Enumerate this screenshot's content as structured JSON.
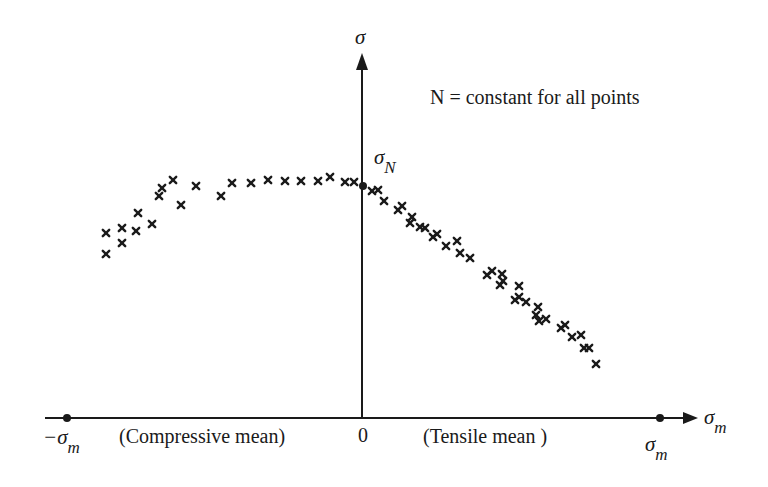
{
  "chart_data": {
    "type": "scatter",
    "title": "",
    "annotation": "N = constant for all points",
    "xlabel": "σm",
    "ylabel": "σ",
    "x_region_labels": [
      "(Compressive mean)",
      "(Tensile mean )"
    ],
    "x_ticks": [
      "−σm",
      "0",
      "σm"
    ],
    "y_marker": "σN",
    "grid": false,
    "legend": "none",
    "marker": "x",
    "points_px": [
      [
        106,
        233
      ],
      [
        106,
        254
      ],
      [
        122,
        228
      ],
      [
        122,
        243
      ],
      [
        138,
        213
      ],
      [
        136,
        231
      ],
      [
        152,
        224
      ],
      [
        159,
        196
      ],
      [
        162,
        188
      ],
      [
        173,
        180
      ],
      [
        181,
        205
      ],
      [
        196,
        186
      ],
      [
        221,
        196
      ],
      [
        232,
        183
      ],
      [
        251,
        183
      ],
      [
        268,
        180
      ],
      [
        285,
        181
      ],
      [
        301,
        181
      ],
      [
        318,
        181
      ],
      [
        330,
        177
      ],
      [
        345,
        182
      ],
      [
        354,
        182
      ],
      [
        372,
        191
      ],
      [
        378,
        190
      ],
      [
        384,
        201
      ],
      [
        398,
        210
      ],
      [
        402,
        206
      ],
      [
        412,
        217
      ],
      [
        410,
        223
      ],
      [
        420,
        227
      ],
      [
        425,
        228
      ],
      [
        433,
        237
      ],
      [
        437,
        234
      ],
      [
        446,
        246
      ],
      [
        457,
        241
      ],
      [
        460,
        253
      ],
      [
        470,
        258
      ],
      [
        487,
        275
      ],
      [
        492,
        271
      ],
      [
        502,
        274
      ],
      [
        500,
        285
      ],
      [
        503,
        281
      ],
      [
        519,
        286
      ],
      [
        515,
        300
      ],
      [
        519,
        297
      ],
      [
        526,
        302
      ],
      [
        536,
        315
      ],
      [
        538,
        307
      ],
      [
        539,
        321
      ],
      [
        546,
        319
      ],
      [
        561,
        328
      ],
      [
        565,
        325
      ],
      [
        572,
        337
      ],
      [
        581,
        335
      ],
      [
        584,
        348
      ],
      [
        589,
        348
      ],
      [
        596,
        364
      ]
    ]
  },
  "figure": {
    "y_axis_label": "σ",
    "x_axis_label": "σ",
    "x_axis_label_sub": "m",
    "sigma_n": "σ",
    "sigma_n_sub": "N",
    "annotation": "N = constant for all points",
    "neg_sigma_m": "−σ",
    "neg_sigma_m_sub": "m",
    "compressive_label": "(Compressive mean)",
    "zero_label": "0",
    "tensile_label": "(Tensile mean )",
    "pos_sigma_m": "σ",
    "pos_sigma_m_sub": "m"
  }
}
